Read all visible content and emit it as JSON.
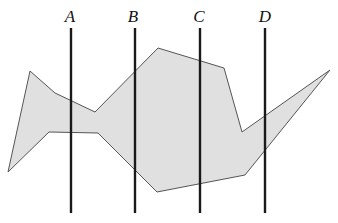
{
  "figure": {
    "width": 338,
    "height": 223,
    "background_color": "#ffffff"
  },
  "region": {
    "name": "shaded-region",
    "fill_color": "#e0e0e0",
    "stroke_color": "#555555",
    "stroke_width": 1,
    "vertices": [
      [
        30,
        71
      ],
      [
        55,
        93
      ],
      [
        95,
        112
      ],
      [
        158,
        48
      ],
      [
        224,
        68
      ],
      [
        242,
        132
      ],
      [
        330,
        70
      ],
      [
        245,
        175
      ],
      [
        157,
        192
      ],
      [
        98,
        133
      ],
      [
        49,
        132
      ],
      [
        8,
        172
      ]
    ]
  },
  "vertical_lines": {
    "stroke_color": "#1a1a1a",
    "stroke_width": 2.4,
    "y_top": 28,
    "y_bottom": 213,
    "items": [
      {
        "label": "A",
        "x": 71,
        "label_x": 70,
        "label_y": 8
      },
      {
        "label": "B",
        "x": 135,
        "label_x": 133,
        "label_y": 8
      },
      {
        "label": "C",
        "x": 200,
        "label_x": 199,
        "label_y": 8
      },
      {
        "label": "D",
        "x": 265,
        "label_x": 265,
        "label_y": 8
      }
    ]
  }
}
